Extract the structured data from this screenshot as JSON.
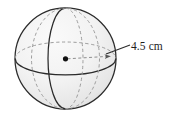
{
  "figure": {
    "type": "geometry-diagram",
    "shape_name": "sphere",
    "title": "",
    "background_color": "#ffffff",
    "labels": {
      "radius_label": "4.5 cm"
    },
    "measurement": {
      "value": "4.5",
      "unit": "cm",
      "quantity": "radius",
      "text": "4.5 cm"
    },
    "geometry": {
      "center_x": 65.5,
      "center_y": 58.5,
      "radius": 51,
      "outline_color": "#2a2a2a",
      "fill_color": "#f0f0f0",
      "hidden_line_color": "#9a9a9a",
      "center_dot_color": "#111111",
      "leader_line_color": "#2a2a2a"
    },
    "elements": {
      "sphere_outline": "sphere-outline",
      "equator_front": "equator-front-arc",
      "equator_back": "equator-back-arc",
      "meridian_front": "meridian-front-arc",
      "meridian_back": "meridian-back-arc",
      "hidden_meridian": "hidden-meridian-ellipse",
      "center_point": "center-dot",
      "radius_arrow": "radius-arrow",
      "leader_line": "leader-line"
    }
  }
}
